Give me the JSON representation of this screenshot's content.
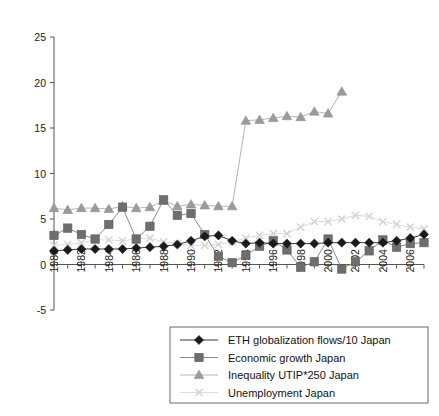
{
  "chart_data": {
    "type": "line",
    "title": "",
    "subtitle": "",
    "xlabel": "",
    "ylabel": "",
    "ylim": [
      -5,
      25
    ],
    "yticks": [
      -5,
      0,
      5,
      10,
      15,
      20,
      25
    ],
    "ytick_labels": [
      "-5",
      "0",
      "5",
      "10",
      "15",
      "20",
      "25"
    ],
    "xlim": [
      1980,
      2007
    ],
    "x": [
      1980,
      1981,
      1982,
      1983,
      1984,
      1985,
      1986,
      1987,
      1988,
      1989,
      1990,
      1991,
      1992,
      1993,
      1994,
      1995,
      1996,
      1997,
      1998,
      1999,
      2000,
      2001,
      2002,
      2003,
      2004,
      2005,
      2006,
      2007
    ],
    "xtick_labels": [
      "1980",
      "1982",
      "1984",
      "1986",
      "1988",
      "1990",
      "1992",
      "1994",
      "1996",
      "1998",
      "2000",
      "2002",
      "2004",
      "2006"
    ],
    "xtick_values": [
      1980,
      1982,
      1984,
      1986,
      1988,
      1990,
      1992,
      1994,
      1996,
      1998,
      2000,
      2002,
      2004,
      2006
    ],
    "grid": false,
    "legend_position": "bottom",
    "series": [
      {
        "name": "ETH globalization flows/10 Japan",
        "marker": "diamond",
        "color": "#1a1a1a",
        "line_color": "#3a3a3a",
        "values": [
          1.5,
          1.6,
          1.7,
          1.7,
          1.7,
          1.7,
          1.8,
          1.9,
          2.0,
          2.2,
          2.6,
          3.1,
          3.2,
          2.6,
          2.3,
          2.4,
          2.3,
          2.3,
          2.3,
          2.3,
          2.4,
          2.4,
          2.4,
          2.4,
          2.4,
          2.6,
          2.9,
          3.3
        ]
      },
      {
        "name": "Economic growth Japan",
        "marker": "square",
        "color": "#6e6e6e",
        "line_color": "#8a8a8a",
        "values": [
          3.2,
          4.0,
          3.3,
          2.8,
          4.4,
          6.3,
          2.8,
          4.2,
          7.1,
          5.4,
          5.6,
          3.3,
          0.9,
          0.2,
          1.0,
          2.0,
          2.6,
          1.6,
          -0.3,
          0.3,
          2.8,
          -0.5,
          0.3,
          1.5,
          2.7,
          1.9,
          2.3,
          2.4
        ]
      },
      {
        "name": "Inequality UTIP*250 Japan",
        "marker": "triangle",
        "color": "#9b9b9b",
        "line_color": "#b5b5b5",
        "values": [
          6.2,
          6.0,
          6.2,
          6.2,
          6.1,
          6.4,
          6.2,
          6.3,
          7.0,
          6.4,
          6.6,
          6.5,
          6.4,
          6.4,
          15.8,
          15.9,
          16.1,
          16.3,
          16.2,
          16.8,
          16.6,
          19.0,
          null,
          null,
          null,
          null,
          null,
          null
        ]
      },
      {
        "name": "Unemployment Japan",
        "marker": "cross",
        "color": "#d2d2d2",
        "line_color": "#dcdcdc",
        "values": [
          2.1,
          2.2,
          2.4,
          2.7,
          2.7,
          2.6,
          2.8,
          2.9,
          2.5,
          2.3,
          2.1,
          2.1,
          2.2,
          2.5,
          2.9,
          3.2,
          3.4,
          3.4,
          4.1,
          4.7,
          4.7,
          5.0,
          5.4,
          5.3,
          4.7,
          4.4,
          4.1,
          3.9
        ]
      }
    ]
  },
  "legend": {
    "items": [
      {
        "label": "ETH globalization flows/10 Japan",
        "marker": "diamond-marker"
      },
      {
        "label": "Economic growth Japan",
        "marker": "square-marker"
      },
      {
        "label": "Inequality UTIP*250 Japan",
        "marker": "triangle-marker"
      },
      {
        "label": "Unemployment Japan",
        "marker": "cross-marker"
      }
    ]
  },
  "colors": {
    "series_1": "#1a1a1a",
    "series_2": "#6e6e6e",
    "series_3": "#9b9b9b",
    "series_4": "#d2d2d2",
    "axis": "#555555",
    "background": "#ffffff"
  }
}
